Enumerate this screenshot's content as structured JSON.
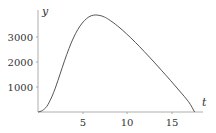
{
  "chart_data": {
    "type": "line",
    "title": "",
    "xlabel": "t",
    "ylabel": "y",
    "xlim": [
      0,
      18.5
    ],
    "ylim": [
      0,
      4000
    ],
    "grid": false,
    "legend": null,
    "x_ticks": [
      5,
      10,
      15
    ],
    "y_ticks": [
      1000,
      2000,
      3000
    ],
    "x_tick_labels": [
      "5",
      "10",
      "15"
    ],
    "y_tick_labels": [
      "1000",
      "2000",
      "3000"
    ],
    "series": [
      {
        "name": "y(t)",
        "x": [
          0,
          0.5,
          1,
          1.5,
          2,
          2.5,
          3,
          3.5,
          4,
          4.5,
          5,
          5.5,
          6,
          6.5,
          7,
          7.5,
          8,
          9,
          10,
          11,
          12,
          13,
          14,
          15,
          16,
          17,
          17.7
        ],
        "values": [
          0,
          60,
          230,
          560,
          1000,
          1520,
          2050,
          2540,
          2960,
          3300,
          3560,
          3740,
          3850,
          3880,
          3860,
          3800,
          3700,
          3440,
          3130,
          2790,
          2420,
          2040,
          1650,
          1250,
          840,
          420,
          0
        ]
      }
    ],
    "color": "#555555"
  },
  "labels": {
    "x_axis": "t",
    "y_axis": "y",
    "xt": [
      "5",
      "10",
      "15"
    ],
    "yt": [
      "1000",
      "2000",
      "3000"
    ]
  }
}
